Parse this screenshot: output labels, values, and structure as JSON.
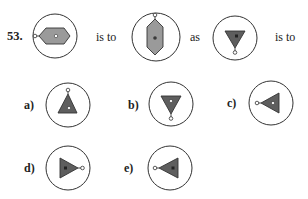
{
  "question": {
    "number": "53.",
    "connectors": [
      "is to",
      "as",
      "is to"
    ],
    "stem_figures": [
      {
        "id": "stem-1",
        "shape": "hexagon-horizontal",
        "fill": "#9a9a9a",
        "center_dot": "white",
        "pendant": "left"
      },
      {
        "id": "stem-2",
        "shape": "hexagon-vertical",
        "fill": "#9a9a9a",
        "center_dot": "dark",
        "pendant": "top"
      },
      {
        "id": "stem-3",
        "shape": "triangle-down",
        "fill": "#5e5e5e",
        "center_dot": "dark",
        "pendant": "bottom"
      }
    ]
  },
  "options": [
    {
      "label": "a)",
      "shape": "triangle-up",
      "fill": "#5e5e5e",
      "center_dot": "white",
      "pendant": "top"
    },
    {
      "label": "b)",
      "shape": "triangle-down",
      "fill": "#5e5e5e",
      "center_dot": "white",
      "pendant": "bottom"
    },
    {
      "label": "c)",
      "shape": "triangle-left",
      "fill": "#5e5e5e",
      "center_dot": "white",
      "pendant": "left"
    },
    {
      "label": "d)",
      "shape": "triangle-right",
      "fill": "#5e5e5e",
      "center_dot": "dark",
      "pendant": "right"
    },
    {
      "label": "e)",
      "shape": "triangle-left",
      "fill": "#5e5e5e",
      "center_dot": "dark",
      "pendant": "left"
    }
  ],
  "colors": {
    "outline": "#333333",
    "hexagon_fill": "#9a9a9a",
    "triangle_fill": "#5e5e5e",
    "dark_dot": "#3a3a3a",
    "background": "#ffffff"
  }
}
